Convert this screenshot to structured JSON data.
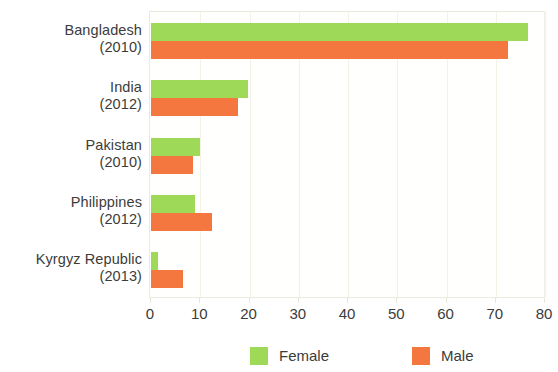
{
  "chart_data": {
    "type": "bar",
    "orientation": "horizontal",
    "title": "",
    "subtitle": "",
    "xlabel": "",
    "ylabel": "",
    "xlim": [
      0,
      80
    ],
    "ylim": null,
    "grid": true,
    "grid_axis": "x",
    "legend_position": "bottom",
    "categories": [
      "Bangladesh\n(2010)",
      "India\n(2012)",
      "Pakistan\n(2010)",
      "Philippines\n(2012)",
      "Kyrgyz Republic\n(2013)"
    ],
    "category_names": [
      "Bangladesh",
      "India",
      "Pakistan",
      "Philippines",
      "Kyrgyz Republic"
    ],
    "category_years": [
      "(2010)",
      "(2012)",
      "(2010)",
      "(2012)",
      "(2013)"
    ],
    "series": [
      {
        "name": "Female",
        "color": "#9ed957",
        "values": [
          76.5,
          19.7,
          9.9,
          9.0,
          1.5
        ]
      },
      {
        "name": "Male",
        "color": "#f4773f",
        "values": [
          72.5,
          17.7,
          8.5,
          12.3,
          6.5
        ]
      }
    ],
    "xticks": [
      0,
      10,
      20,
      30,
      40,
      50,
      60,
      70,
      80
    ],
    "xtick_labels": [
      "0",
      "10",
      "20",
      "30",
      "40",
      "50",
      "60",
      "70",
      "80"
    ]
  },
  "legend": {
    "items": [
      {
        "label": "Female",
        "color": "#9ed957"
      },
      {
        "label": "Male",
        "color": "#f4773f"
      }
    ]
  },
  "colors": {
    "female": "#9ed957",
    "male": "#f4773f",
    "grid": "#f4f2e6",
    "axis": "#eceadf",
    "text": "#3c3c3a",
    "background": "#ffffff"
  }
}
